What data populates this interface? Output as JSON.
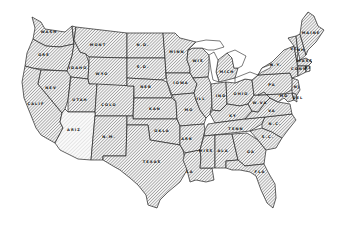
{
  "map": {
    "title": "United States outline map",
    "style": "hatched",
    "colors": {
      "stroke": "#222222",
      "hatch": "#555555",
      "background": "#ffffff"
    },
    "states": [
      {
        "id": "wash",
        "label": "WASH",
        "x": 49,
        "y": 33,
        "points": "32,17 41,22 45,29 65,32 72,26 74,44 60,47 46,46 38,42 33,39 35,28"
      },
      {
        "id": "ore",
        "label": "ORE",
        "x": 44,
        "y": 56,
        "points": "33,39 38,42 46,46 60,47 74,44 72,56 67,71 50,70 32,68 25,66 27,53"
      },
      {
        "id": "calif",
        "label": "CALIF",
        "x": 36,
        "y": 105,
        "points": "25,66 32,68 41,70 38,84 62,113 60,122 63,128 55,143 46,138 41,135 36,128 30,113 24,98 22,82"
      },
      {
        "id": "nev",
        "label": "NEV",
        "x": 51,
        "y": 89,
        "points": "41,70 67,71 71,72 68,100 65,109 62,113 38,84"
      },
      {
        "id": "idaho",
        "label": "IDAHO",
        "x": 78,
        "y": 69,
        "points": "72,26 76,27 74,40 80,52 86,54 89,63 88,79 71,77 67,71 72,56 74,44"
      },
      {
        "id": "mont",
        "label": "MONT",
        "x": 98,
        "y": 46,
        "points": "76,27 127,33 127,58 89,57 86,54 80,52 74,40"
      },
      {
        "id": "wyo",
        "label": "WYO",
        "x": 102,
        "y": 75,
        "points": "89,57 127,58 127,86 89,84 88,79 89,63"
      },
      {
        "id": "utah",
        "label": "UTAH",
        "x": 80,
        "y": 101,
        "points": "71,77 88,79 89,84 97,84 95,112 68,112 68,100"
      },
      {
        "id": "colo",
        "label": "COLO",
        "x": 109,
        "y": 106,
        "points": "97,84 134,86 133,116 95,116 95,112"
      },
      {
        "id": "ariz",
        "label": "ARIZ",
        "x": 74,
        "y": 131,
        "light": true,
        "points": "68,112 95,112 95,116 91,160 78,159 60,150 55,143 63,128 60,122 62,113 65,109"
      },
      {
        "id": "nm",
        "label": "N.M.",
        "x": 109,
        "y": 138,
        "points": "95,116 127,116 126,156 103,156 103,160 91,160"
      },
      {
        "id": "nd",
        "label": "N.D.",
        "x": 143,
        "y": 46,
        "points": "127,33 163,33 165,58 127,58"
      },
      {
        "id": "sd",
        "label": "S.D.",
        "x": 143,
        "y": 68,
        "points": "127,58 165,58 166,78 162,80 127,78"
      },
      {
        "id": "neb",
        "label": "NEB",
        "x": 146,
        "y": 88,
        "points": "127,78 162,80 167,82 172,98 134,98 134,86 127,86"
      },
      {
        "id": "kan",
        "label": "KAN",
        "x": 155,
        "y": 110,
        "points": "134,98 172,98 176,102 177,119 133,119"
      },
      {
        "id": "okla",
        "label": "OKLA",
        "x": 162,
        "y": 132,
        "points": "127,116 133,116 133,119 177,119 180,126 180,145 168,143 150,140 148,125 127,125"
      },
      {
        "id": "texas",
        "label": "TEXAS",
        "x": 152,
        "y": 163,
        "points": "127,125 148,125 150,140 168,143 180,145 183,150 187,170 180,182 168,192 160,200 157,208 148,205 146,195 138,185 130,178 120,170 113,166 103,160 103,156 126,156"
      },
      {
        "id": "minn",
        "label": "MINN",
        "x": 177,
        "y": 53,
        "points": "163,33 175,33 180,38 196,42 188,50 187,60 190,68 190,73 166,73 165,58"
      },
      {
        "id": "iowa",
        "label": "IOWA",
        "x": 181,
        "y": 84,
        "points": "166,73 190,73 193,78 197,84 194,93 172,95 167,82"
      },
      {
        "id": "mo",
        "label": "MO",
        "x": 189,
        "y": 111,
        "points": "172,95 194,93 196,100 200,110 206,118 204,124 180,126 177,119 176,102"
      },
      {
        "id": "ark",
        "label": "ARK",
        "x": 187,
        "y": 140,
        "points": "180,126 204,124 205,130 200,150 185,153 180,145"
      },
      {
        "id": "la",
        "label": "LA",
        "x": 190,
        "y": 173,
        "points": "185,153 200,150 201,158 200,168 212,168 214,180 206,182 196,180 190,182 187,170 183,160"
      },
      {
        "id": "wis",
        "label": "WIS",
        "x": 198,
        "y": 62,
        "points": "188,50 193,48 202,48 209,55 209,70 208,77 193,78 190,73 190,68 187,60"
      },
      {
        "id": "ill",
        "label": "ILL",
        "x": 201,
        "y": 100,
        "points": "193,78 208,77 211,84 212,104 210,114 206,118 200,110 196,100 194,93 197,84"
      },
      {
        "id": "mich",
        "label": "MICH",
        "x": 227,
        "y": 73,
        "points": "218,60 227,53 232,58 234,68 238,68 235,78 219,82 216,72"
      },
      {
        "id": "ind",
        "label": "IND",
        "x": 221,
        "y": 97,
        "points": "211,84 226,82 227,104 220,111 212,110 212,104"
      },
      {
        "id": "ohio",
        "label": "OHIO",
        "x": 241,
        "y": 95,
        "points": "226,82 235,83 245,79 252,80 254,95 248,104 240,106 227,104"
      },
      {
        "id": "ky",
        "label": "KY",
        "x": 233,
        "y": 117,
        "points": "210,114 212,110 220,111 227,104 240,106 248,104 252,111 245,119 215,123"
      },
      {
        "id": "tenn",
        "label": "TENN",
        "x": 236,
        "y": 130,
        "points": "205,130 208,124 215,123 245,119 265,117 262,124 250,131 204,136"
      },
      {
        "id": "miss",
        "label": "MISS",
        "x": 206,
        "y": 152,
        "points": "204,136 215,135 215,168 212,168 200,168 201,158 200,150"
      },
      {
        "id": "ala",
        "label": "ALA",
        "x": 223,
        "y": 152,
        "points": "215,135 232,134 238,160 226,161 226,168 218,168 215,168"
      },
      {
        "id": "ga",
        "label": "GA",
        "x": 251,
        "y": 153,
        "points": "232,134 247,133 258,140 266,150 264,164 245,166 238,160"
      },
      {
        "id": "fla",
        "label": "FLA",
        "x": 260,
        "y": 173,
        "points": "226,161 238,160 245,166 264,164 268,172 275,184 276,198 273,208 267,203 261,190 256,176 250,172 240,170 232,170 226,168"
      },
      {
        "id": "sc",
        "label": "S.C.",
        "x": 268,
        "y": 138,
        "points": "250,131 262,128 272,132 282,138 276,148 266,150 258,140"
      },
      {
        "id": "nc",
        "label": "N.C.",
        "x": 275,
        "y": 125,
        "points": "262,124 265,117 292,114 296,120 288,130 282,138 272,132 262,128"
      },
      {
        "id": "va",
        "label": "VA",
        "x": 272,
        "y": 112,
        "points": "245,119 252,111 258,112 264,104 270,98 278,102 290,104 292,114 265,117"
      },
      {
        "id": "wva",
        "label": "W.VA",
        "x": 260,
        "y": 104,
        "points": "248,104 254,95 258,95 264,92 270,98 264,104 258,112 252,111"
      },
      {
        "id": "pa",
        "label": "PA",
        "x": 272,
        "y": 86,
        "points": "252,80 258,75 290,73 293,80 292,90 284,94 258,95 254,95"
      },
      {
        "id": "md",
        "label": "MD",
        "x": 284,
        "y": 97,
        "points": "264,92 258,95 284,94 292,93 294,100 288,102 284,98 278,102 270,98"
      },
      {
        "id": "nj",
        "label": "NJ",
        "x": 297,
        "y": 88,
        "points": "292,78 298,80 300,90 295,98 292,92 292,86"
      },
      {
        "id": "ny",
        "label": "N.Y.",
        "x": 276,
        "y": 66,
        "points": "258,75 262,68 272,62 278,56 284,50 294,46 297,62 298,76 292,78 290,73"
      },
      {
        "id": "vt",
        "label": "VT",
        "x": 294,
        "y": 50,
        "points": "288,38 296,36 298,52 297,62 294,46"
      },
      {
        "id": "nh",
        "label": "NH",
        "x": 301,
        "y": 51,
        "points": "296,36 300,34 306,55 300,60 298,52"
      },
      {
        "id": "mass",
        "label": "MASS",
        "x": 305,
        "y": 62,
        "points": "297,62 300,60 306,58 312,62 308,66 298,66"
      },
      {
        "id": "conn",
        "label": "CONN",
        "x": 299,
        "y": 70,
        "points": "298,66 306,66 306,72 298,76"
      },
      {
        "id": "ri",
        "label": "RI",
        "x": 308,
        "y": 69,
        "points": "306,66 310,66 310,71 306,72"
      },
      {
        "id": "maine",
        "label": "MAINE",
        "x": 311,
        "y": 34,
        "points": "300,34 302,20 308,12 314,16 318,26 324,30 316,42 308,50 306,55"
      },
      {
        "id": "del",
        "label": "DEL",
        "x": 298,
        "y": 99,
        "points": "292,93 296,94 297,102 294,100"
      }
    ],
    "lakes": [
      {
        "id": "lake-superior",
        "points": "188,50 196,42 206,40 220,41 224,47 214,50 208,50 202,48 193,48"
      },
      {
        "id": "lake-michigan",
        "points": "209,55 214,52 218,60 216,72 219,82 213,80 211,70"
      },
      {
        "id": "lake-huron",
        "points": "227,53 235,50 246,56 242,66 238,68 234,68 232,58"
      },
      {
        "id": "lake-erie",
        "points": "235,78 250,72 258,75 252,80 245,79 235,83"
      },
      {
        "id": "lake-ontario",
        "points": "258,75 262,68 272,64 270,68 262,72"
      }
    ]
  }
}
